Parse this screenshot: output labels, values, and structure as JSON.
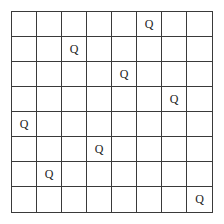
{
  "board": {
    "size": 8,
    "queen_symbol": "Q",
    "queens": [
      {
        "row": 0,
        "col": 5
      },
      {
        "row": 1,
        "col": 2
      },
      {
        "row": 2,
        "col": 4
      },
      {
        "row": 3,
        "col": 6
      },
      {
        "row": 4,
        "col": 0
      },
      {
        "row": 5,
        "col": 3
      },
      {
        "row": 6,
        "col": 1
      },
      {
        "row": 7,
        "col": 7
      }
    ],
    "line_color": "#3a3a3a",
    "background": "#ffffff"
  }
}
